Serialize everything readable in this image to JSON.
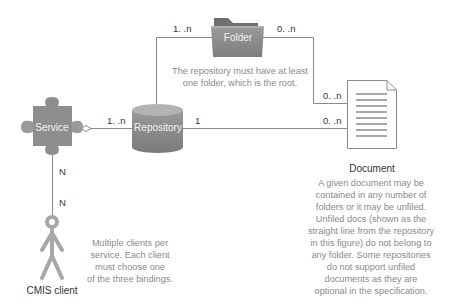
{
  "diagram": {
    "nodes": {
      "folder": {
        "label": "Folder"
      },
      "repository": {
        "label": "Repository"
      },
      "service": {
        "label": "Service"
      },
      "document": {
        "label": "Document"
      },
      "client": {
        "label": "CMIS client"
      }
    },
    "multiplicities": {
      "repo_folder_repo_end": "1. .n",
      "repo_folder_folder_end": "0. .n",
      "folder_document_doc_end": "0. .n",
      "service_repo_repo_end": "1. .n",
      "repo_document_repo_end": "1",
      "repo_document_doc_end": "0. .n",
      "service_client_service_end": "N",
      "service_client_client_end": "N"
    },
    "notes": {
      "folder_note": [
        "The repository must have at least",
        "one folder, which is the root."
      ],
      "client_note": [
        "Multiple clients per",
        "service. Each client",
        "must choose one",
        "of the three bindings."
      ],
      "document_note": [
        "A given document may be",
        "contained in any number of",
        "folders or it may be unfiled.",
        "Unfiled docs (shown as the",
        "straight line from the repository",
        "in this figure) do not belong to",
        "any folder. Some repositories",
        "do not support unfiled",
        "documents as they are",
        "optional in the specification."
      ]
    },
    "colors": {
      "line": "#8c8c8c",
      "shape_fill": "#8e8e8e",
      "shape_dark": "#6f6f6f",
      "shape_light": "#b5b5b5",
      "note_text": "#8a8a8a",
      "label_text": "#333333"
    }
  }
}
